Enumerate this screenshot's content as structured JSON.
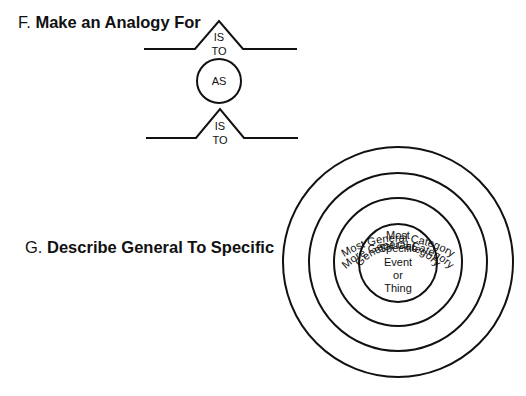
{
  "sections": [
    {
      "letter": "F.",
      "title": "Make an Analogy For",
      "diagram": {
        "type": "analogy",
        "top_connector": {
          "line1": "IS",
          "line2": "TO"
        },
        "middle": "AS",
        "bottom_connector": {
          "line1": "IS",
          "line2": "TO"
        }
      }
    },
    {
      "letter": "G.",
      "title": "Describe General To Specific",
      "diagram": {
        "type": "concentric-circles",
        "rings": [
          {
            "label": "Most General Category"
          },
          {
            "label": "More General Category"
          },
          {
            "label": "General Category"
          }
        ],
        "center_lines": [
          "Most",
          "Specific",
          "Event",
          "or",
          "Thing"
        ]
      }
    }
  ],
  "colors": {
    "stroke": "#111111",
    "background": "#ffffff"
  }
}
